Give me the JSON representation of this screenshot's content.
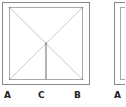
{
  "diagram": {
    "panels": [
      {
        "outer_box": {
          "x": 2,
          "y": 2,
          "w": 87,
          "h": 82
        },
        "inner_square": {
          "x": 9,
          "y": 7,
          "w": 73,
          "h": 72
        },
        "center": {
          "x": 46,
          "y": 43
        },
        "lines": [
          "diagonal-top-left-to-bottom-right",
          "diagonal-top-right-to-bottom-left",
          "vertical-center-to-bottom"
        ],
        "labels": [
          {
            "text": "A",
            "x": 8
          },
          {
            "text": "C",
            "x": 41
          },
          {
            "text": "B",
            "x": 77
          }
        ]
      },
      {
        "outer_box": {
          "x": 114,
          "y": 2,
          "w": 20,
          "h": 82
        },
        "inner_square": {
          "x": 120,
          "y": 7,
          "w": 10,
          "h": 72
        },
        "labels": [
          {
            "text": "A",
            "x": 117
          }
        ]
      }
    ],
    "colors": {
      "outer_box": "#888888",
      "inner_lines": "#aaaaaa",
      "vertical_line": "#666666",
      "label": "#222222"
    }
  }
}
